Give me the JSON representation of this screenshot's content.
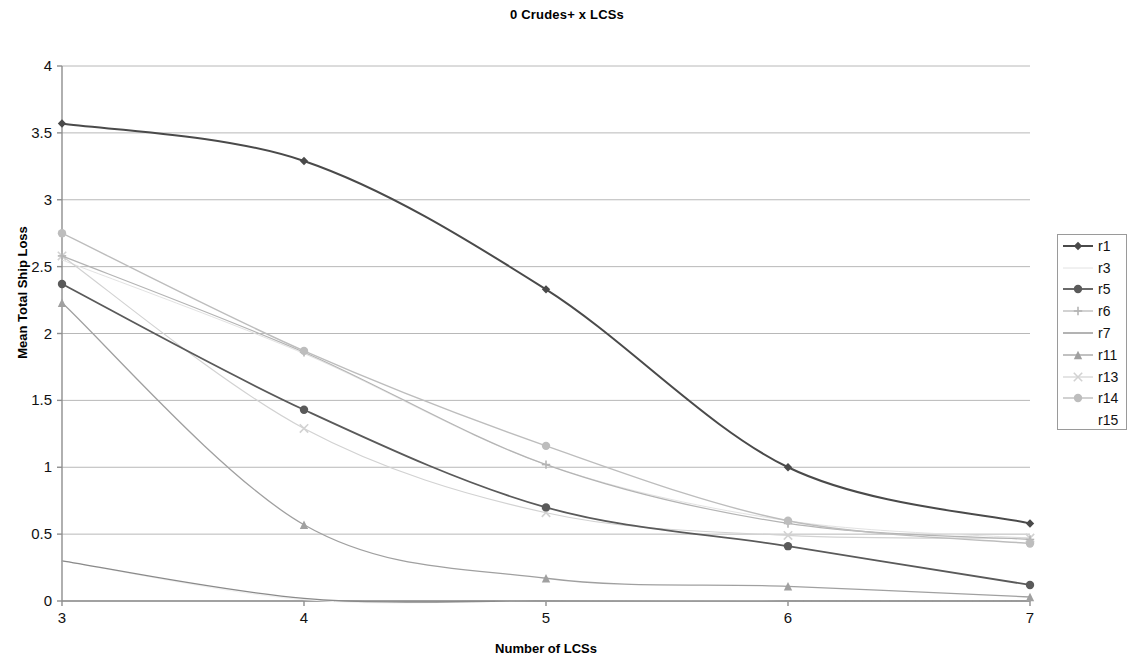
{
  "chart_data": {
    "type": "line",
    "title": "0 Crudes+ x LCSs",
    "xlabel": "Number of LCSs",
    "ylabel": "Mean Total Ship Loss",
    "grid": true,
    "legend_position": "right",
    "xlim": [
      3,
      7
    ],
    "ylim": [
      0,
      4
    ],
    "x": [
      3,
      4,
      5,
      6,
      7
    ],
    "xticks": [
      "3",
      "4",
      "5",
      "6",
      "7"
    ],
    "yticks": [
      "0",
      "0.5",
      "1",
      "1.5",
      "2",
      "2.5",
      "3",
      "3.5",
      "4"
    ],
    "series": [
      {
        "name": "r1",
        "marker": "diamond",
        "color": "#4a4a4a",
        "width": 2.0,
        "values": [
          3.57,
          3.29,
          2.33,
          1.0,
          0.58
        ]
      },
      {
        "name": "r3",
        "marker": "none",
        "color": "#e2e2e2",
        "width": 1.0,
        "values": [
          2.55,
          1.85,
          1.02,
          0.6,
          0.47
        ]
      },
      {
        "name": "r5",
        "marker": "circle",
        "color": "#5a5a5a",
        "width": 1.8,
        "values": [
          2.37,
          1.43,
          0.7,
          0.41,
          0.12
        ]
      },
      {
        "name": "r6",
        "marker": "plus",
        "color": "#b4b4b4",
        "width": 1.2,
        "values": [
          2.58,
          1.86,
          1.02,
          0.58,
          0.46
        ]
      },
      {
        "name": "r7",
        "marker": "none",
        "color": "#8a8a8a",
        "width": 1.3,
        "values": [
          0.3,
          0.02,
          0.0,
          0.0,
          0.0
        ]
      },
      {
        "name": "r11",
        "marker": "triangle",
        "color": "#a0a0a0",
        "width": 1.3,
        "values": [
          2.23,
          0.57,
          0.17,
          0.11,
          0.03
        ]
      },
      {
        "name": "r13",
        "marker": "x",
        "color": "#d2d2d2",
        "width": 1.2,
        "values": [
          2.58,
          1.29,
          0.66,
          0.49,
          0.47
        ]
      },
      {
        "name": "r14",
        "marker": "circle",
        "color": "#bdbdbd",
        "width": 1.4,
        "values": [
          2.75,
          1.87,
          1.16,
          0.6,
          0.43
        ]
      },
      {
        "name": "r15",
        "marker": "none",
        "color": "#f0f0f0",
        "width": 1.0,
        "values": [
          0.3,
          0.01,
          0.0,
          0.0,
          0.0
        ]
      }
    ]
  },
  "legend": {
    "items": [
      {
        "label": "r1"
      },
      {
        "label": "r3"
      },
      {
        "label": "r5"
      },
      {
        "label": "r6"
      },
      {
        "label": "r7"
      },
      {
        "label": "r11"
      },
      {
        "label": "r13"
      },
      {
        "label": "r14"
      },
      {
        "label": "r15"
      }
    ]
  },
  "colors": {
    "axis": "#8e8e8e",
    "grid": "#b8b8b8",
    "text": "#111111",
    "legend_border": "#9a9a9a"
  }
}
